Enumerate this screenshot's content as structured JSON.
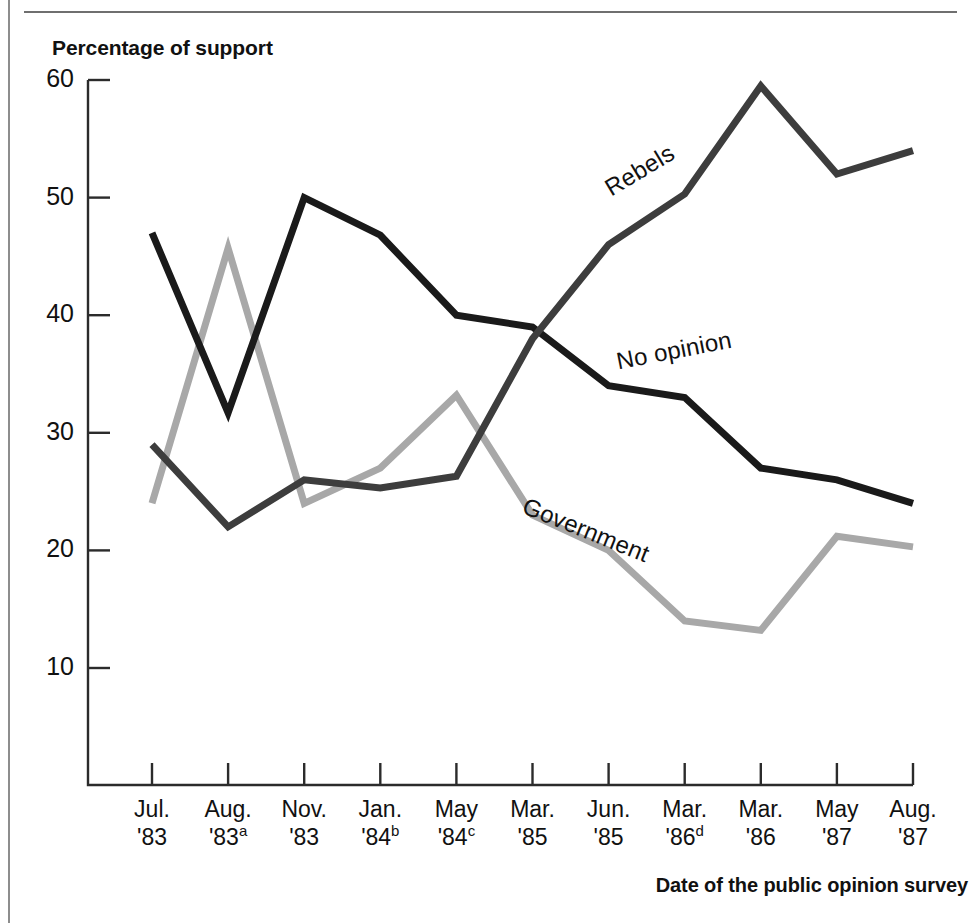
{
  "page": {
    "clipped_header_fragment": "",
    "y_axis_title": "Percentage of support",
    "x_axis_title": "Date of the public opinion survey"
  },
  "colors": {
    "no_opinion": "#1a1a1a",
    "rebels": "#3d3d3d",
    "government": "#a8a8a8",
    "axis": "#2b2b2b",
    "rule": "#8d8d8d"
  },
  "chart_data": {
    "type": "line",
    "title": "",
    "xlabel": "Date of the public opinion survey",
    "ylabel": "Percentage of support",
    "ylim": [
      0,
      60
    ],
    "yticks": [
      10,
      20,
      30,
      40,
      50,
      60
    ],
    "grid": false,
    "legend": "inline-labels",
    "categories": [
      "Jul. '83",
      "Aug. '83a",
      "Nov. '83",
      "Jan. '84b",
      "May '84c",
      "Mar. '85",
      "Jun. '85",
      "Mar. '86d",
      "Mar. '86",
      "May '87",
      "Aug. '87"
    ],
    "category_lines": [
      {
        "month": "Jul.",
        "year": "'83",
        "note": ""
      },
      {
        "month": "Aug.",
        "year": "'83",
        "note": "a"
      },
      {
        "month": "Nov.",
        "year": "'83",
        "note": ""
      },
      {
        "month": "Jan.",
        "year": "'84",
        "note": "b"
      },
      {
        "month": "May",
        "year": "'84",
        "note": "c"
      },
      {
        "month": "Mar.",
        "year": "'85",
        "note": ""
      },
      {
        "month": "Jun.",
        "year": "'85",
        "note": ""
      },
      {
        "month": "Mar.",
        "year": "'86",
        "note": "d"
      },
      {
        "month": "Mar.",
        "year": "'86",
        "note": ""
      },
      {
        "month": "May",
        "year": "'87",
        "note": ""
      },
      {
        "month": "Aug.",
        "year": "'87",
        "note": ""
      }
    ],
    "series": [
      {
        "name": "Rebels",
        "color": "#3d3d3d",
        "values": [
          29,
          22,
          26,
          25.3,
          26.3,
          38,
          46,
          50.3,
          59.5,
          52,
          54
        ]
      },
      {
        "name": "No opinion",
        "color": "#1a1a1a",
        "values": [
          47,
          31.7,
          50,
          46.8,
          40,
          39,
          34,
          33,
          27,
          26,
          24
        ]
      },
      {
        "name": "Government",
        "color": "#a8a8a8",
        "values": [
          24,
          45.7,
          24,
          27,
          33.2,
          23,
          20,
          14,
          13.2,
          21.2,
          20.3
        ]
      }
    ],
    "series_label_positions": [
      {
        "name": "Rebels",
        "x": 600,
        "y": 178,
        "rotate": -31
      },
      {
        "name": "No opinion",
        "x": 614,
        "y": 348,
        "rotate": -11
      },
      {
        "name": "Government",
        "x": 529,
        "y": 492,
        "rotate": 22
      }
    ]
  }
}
